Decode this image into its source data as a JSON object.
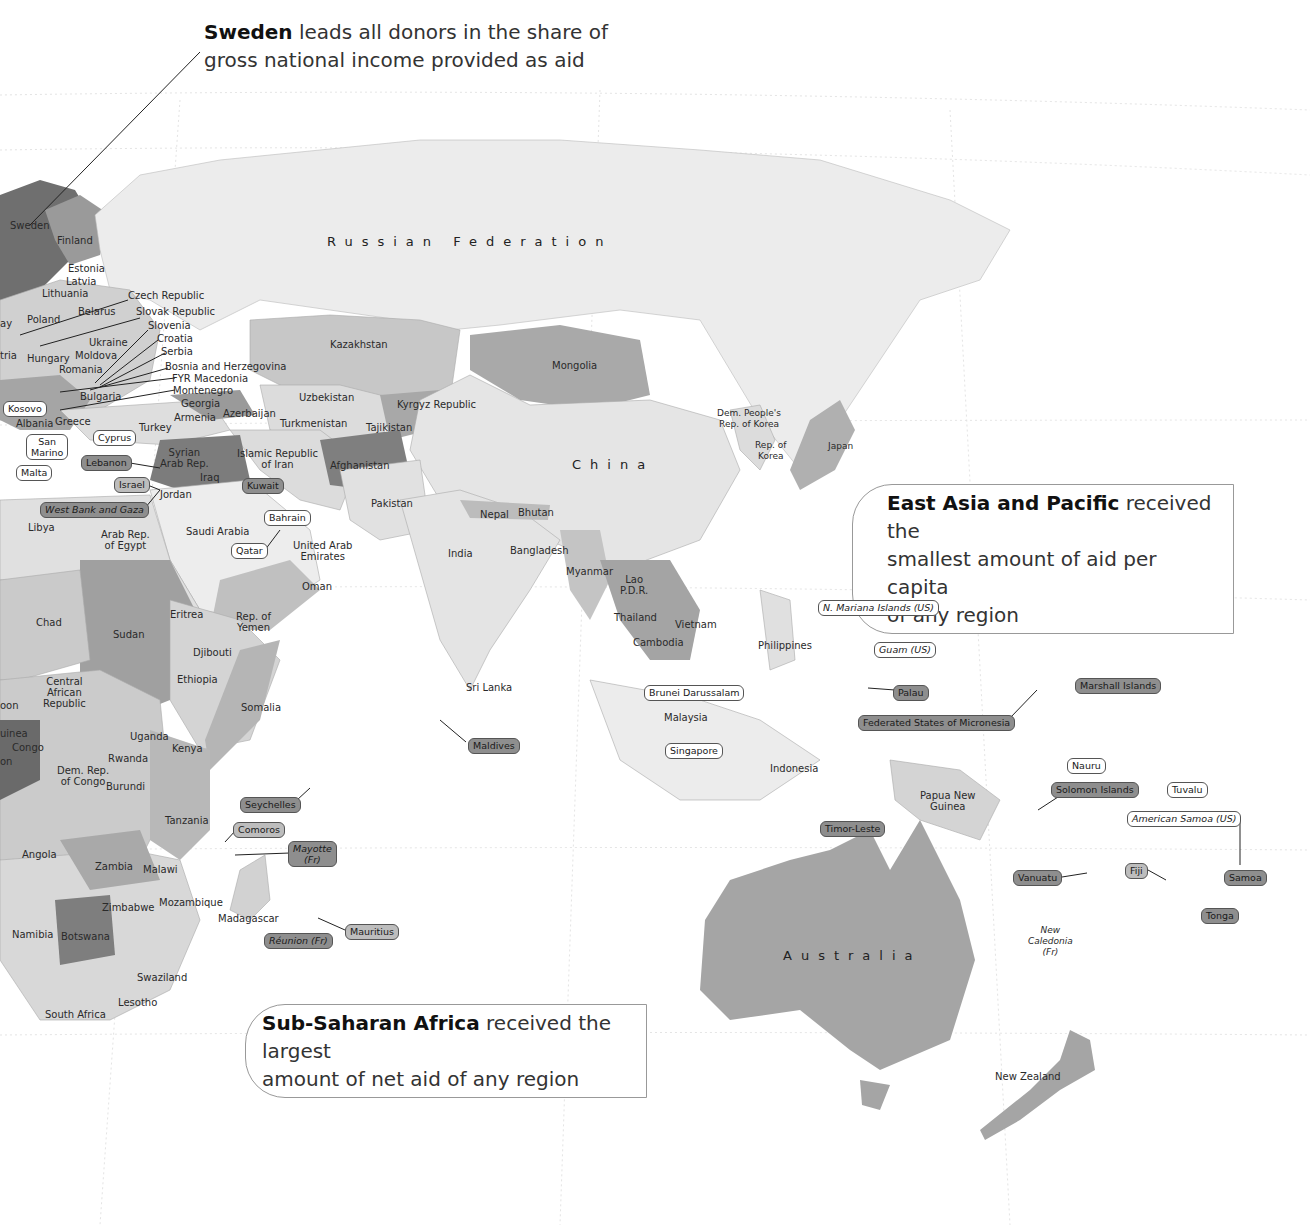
{
  "callouts": {
    "sweden": {
      "bold": "Sweden",
      "text1": " leads all donors in the share of",
      "text2": "gross national income provided as aid"
    },
    "east_asia": {
      "bold": "East Asia and Pacific",
      "text1": " received the",
      "text2": "smallest amount of aid per capita",
      "text3": "of any region"
    },
    "africa": {
      "bold": "Sub-Saharan Africa",
      "text1": " received the largest",
      "text2": "amount of net aid of any region"
    }
  },
  "regions_large": {
    "russia": "Russian Federation",
    "china": "China",
    "australia": "Australia"
  },
  "countries": {
    "sweden": "Sweden",
    "finland": "Finland",
    "estonia": "Estonia",
    "latvia": "Latvia",
    "lithuania": "Lithuania",
    "poland": "Poland",
    "belarus": "Belarus",
    "ukraine": "Ukraine",
    "hungary": "Hungary",
    "moldova": "Moldova",
    "romania": "Romania",
    "bulgaria": "Bulgaria",
    "austria_partial": "tria",
    "norway_partial": "ay",
    "czech": "Czech Republic",
    "slovak": "Slovak Republic",
    "slovenia": "Slovenia",
    "croatia": "Croatia",
    "serbia": "Serbia",
    "bosnia": "Bosnia and Herzegovina",
    "macedonia": "FYR Macedonia",
    "montenegro": "Montenegro",
    "georgia": "Georgia",
    "armenia": "Armenia",
    "azerbaijan": "Azerbaijan",
    "albania": "Albania",
    "greece": "Greece",
    "turkey": "Turkey",
    "syria1": "Syrian",
    "syria2": "Arab Rep.",
    "iraq": "Iraq",
    "jordan": "Jordan",
    "iran1": "Islamic Republic",
    "iran2": "of Iran",
    "saudi": "Saudi Arabia",
    "uae1": "United Arab",
    "uae2": "Emirates",
    "oman": "Oman",
    "yemen1": "Rep. of",
    "yemen2": "Yemen",
    "libya": "Libya",
    "egypt1": "Arab Rep.",
    "egypt2": "of Egypt",
    "kazakhstan": "Kazakhstan",
    "uzbekistan": "Uzbekistan",
    "turkmenistan": "Turkmenistan",
    "kyrgyz": "Kyrgyz Republic",
    "tajikistan": "Tajikistan",
    "afghanistan": "Afghanistan",
    "pakistan": "Pakistan",
    "mongolia": "Mongolia",
    "india": "India",
    "nepal": "Nepal",
    "bhutan": "Bhutan",
    "bangladesh": "Bangladesh",
    "sri_lanka": "Sri Lanka",
    "myanmar": "Myanmar",
    "lao1": "Lao",
    "lao2": "P.D.R.",
    "thailand": "Thailand",
    "vietnam": "Vietnam",
    "cambodia": "Cambodia",
    "philippines": "Philippines",
    "malaysia": "Malaysia",
    "indonesia": "Indonesia",
    "png1": "Papua New",
    "png2": "Guinea",
    "dprk1": "Dem. People's",
    "dprk2": "Rep. of Korea",
    "rok1": "Rep. of",
    "rok2": "Korea",
    "japan": "Japan",
    "new_zealand": "New Zealand",
    "new_caledonia1": "New",
    "new_caledonia2": "Caledonia",
    "new_caledonia3": "(Fr)",
    "chad": "Chad",
    "sudan": "Sudan",
    "eritrea": "Eritrea",
    "djibouti": "Djibouti",
    "ethiopia": "Ethiopia",
    "somalia": "Somalia",
    "car1": "Central",
    "car2": "African",
    "car3": "Republic",
    "gabon_partial": "oon",
    "guinea_partial": "uinea",
    "congo": "Congo",
    "on_partial": "on",
    "uganda": "Uganda",
    "kenya": "Kenya",
    "rwanda": "Rwanda",
    "burundi": "Burundi",
    "drc1": "Dem. Rep.",
    "drc2": "of Congo",
    "tanzania": "Tanzania",
    "angola": "Angola",
    "zambia": "Zambia",
    "malawi": "Malawi",
    "zimbabwe": "Zimbabwe",
    "mozambique": "Mozambique",
    "madagascar": "Madagascar",
    "namibia": "Namibia",
    "botswana": "Botswana",
    "swaziland": "Swaziland",
    "lesotho": "Lesotho",
    "south_africa": "South Africa"
  },
  "pills": {
    "kosovo": "Kosovo",
    "san_marino1": "San",
    "san_marino2": "Marino",
    "malta": "Malta",
    "cyprus": "Cyprus",
    "lebanon": "Lebanon",
    "israel": "Israel",
    "west_bank": "West Bank and Gaza",
    "kuwait": "Kuwait",
    "bahrain": "Bahrain",
    "qatar": "Qatar",
    "maldives": "Maldives",
    "brunei": "Brunei Darussalam",
    "singapore": "Singapore",
    "timor": "Timor-Leste",
    "seychelles": "Seychelles",
    "comoros": "Comoros",
    "mayotte1": "Mayotte",
    "mayotte2": "(Fr)",
    "mauritius": "Mauritius",
    "reunion": "Réunion (Fr)",
    "n_mariana": "N. Mariana Islands (US)",
    "guam": "Guam (US)",
    "palau": "Palau",
    "micronesia": "Federated States of Micronesia",
    "marshall": "Marshall Islands",
    "nauru": "Nauru",
    "solomon": "Solomon Islands",
    "tuvalu": "Tuvalu",
    "american_samoa": "American Samoa (US)",
    "vanuatu": "Vanuatu",
    "fiji": "Fiji",
    "samoa": "Samoa",
    "tonga": "Tonga"
  },
  "colors": {
    "darkest": "#6f6f6f",
    "dark": "#8e8e8e",
    "mid": "#b4b4b4",
    "light": "#d3d3d3",
    "lightest": "#e9e9e9",
    "water": "#ffffff"
  }
}
